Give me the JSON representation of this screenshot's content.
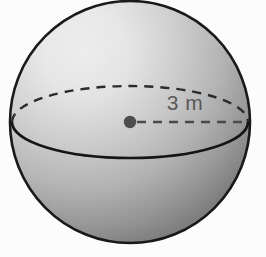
{
  "figure": {
    "shape_name": "sphere",
    "background_color": "#fcfcfc",
    "outline_color": "#1a1a1a",
    "labels": {
      "radius": "3 m"
    },
    "measurements": {
      "radius_value": "3",
      "radius_unit": "m"
    },
    "geometry": {
      "center_x": 130,
      "center_y": 122,
      "sphere_radius_x": 120,
      "sphere_radius_y": 121,
      "equator_rx": 118,
      "equator_ry": 36,
      "center_dot_radius": 6,
      "radius_line_start_x": 136,
      "radius_line_end_x": 248
    },
    "colors": {
      "highlight": "#f2f2f2",
      "midtone": "#bdbdbd",
      "shadow": "#7d7d7d",
      "outline": "#1a1a1a",
      "dash": "#2b2b2b",
      "text": "#595959",
      "dot": "#4d4d4d"
    },
    "line_styles": {
      "back_equator": "dashed",
      "front_equator": "solid",
      "radius_line": "dashed"
    }
  }
}
